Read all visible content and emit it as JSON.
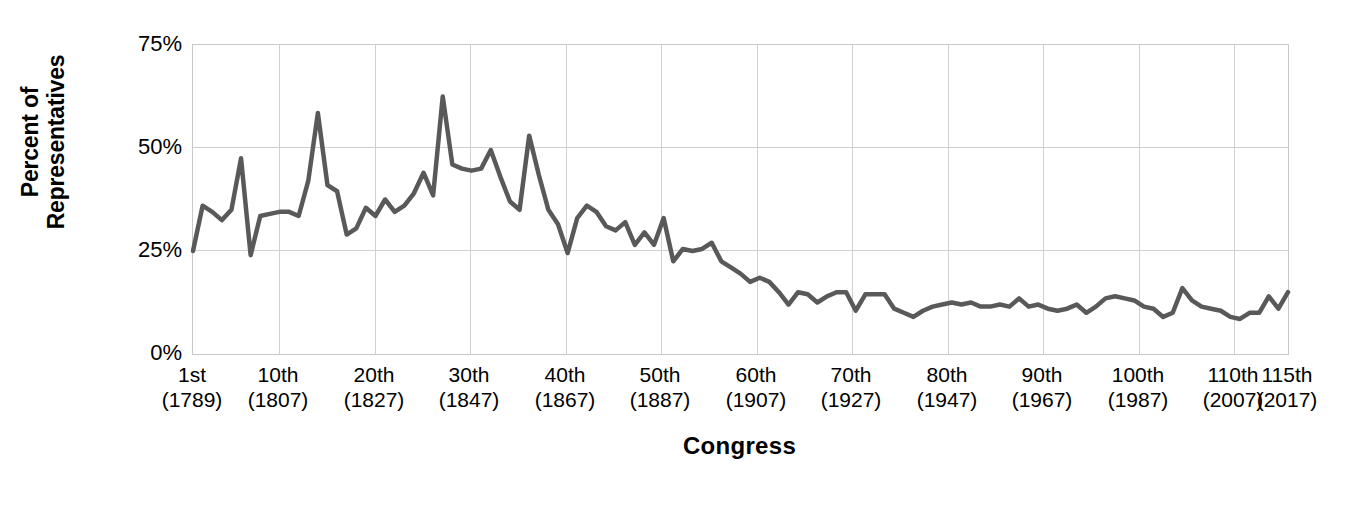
{
  "chart_data": {
    "type": "line",
    "title": "",
    "subtitle": "",
    "xlabel": "Congress",
    "ylabel": "Percent of\nRepresentatives",
    "ylabel_line1": "Percent of",
    "ylabel_line2": "Representatives",
    "ylim": [
      0,
      75
    ],
    "yticks": [
      0,
      25,
      50,
      75
    ],
    "ytick_labels": [
      "0%",
      "25%",
      "50%",
      "75%"
    ],
    "xlim": [
      1,
      115
    ],
    "grid": true,
    "legend": false,
    "legend_position": "none",
    "line_color": "#595959",
    "line_width": 4.5,
    "grid_color": "#d0d0d0",
    "background": "#ffffff",
    "xtick_positions": [
      1,
      10,
      20,
      30,
      40,
      50,
      60,
      70,
      80,
      90,
      100,
      110,
      115
    ],
    "xtick_labels": [
      {
        "ordinal": "1st",
        "year": "(1789)"
      },
      {
        "ordinal": "10th",
        "year": "(1807)"
      },
      {
        "ordinal": "20th",
        "year": "(1827)"
      },
      {
        "ordinal": "30th",
        "year": "(1847)"
      },
      {
        "ordinal": "40th",
        "year": "(1867)"
      },
      {
        "ordinal": "50th",
        "year": "(1887)"
      },
      {
        "ordinal": "60th",
        "year": "(1907)"
      },
      {
        "ordinal": "70th",
        "year": "(1927)"
      },
      {
        "ordinal": "80th",
        "year": "(1947)"
      },
      {
        "ordinal": "90th",
        "year": "(1967)"
      },
      {
        "ordinal": "100th",
        "year": "(1987)"
      },
      {
        "ordinal": "110th",
        "year": "(2007)"
      },
      {
        "ordinal": "115th",
        "year": "(2017)"
      }
    ],
    "x": [
      1,
      2,
      3,
      4,
      5,
      6,
      7,
      8,
      9,
      10,
      11,
      12,
      13,
      14,
      15,
      16,
      17,
      18,
      19,
      20,
      21,
      22,
      23,
      24,
      25,
      26,
      27,
      28,
      29,
      30,
      31,
      32,
      33,
      34,
      35,
      36,
      37,
      38,
      39,
      40,
      41,
      42,
      43,
      44,
      45,
      46,
      47,
      48,
      49,
      50,
      51,
      52,
      53,
      54,
      55,
      56,
      57,
      58,
      59,
      60,
      61,
      62,
      63,
      64,
      65,
      66,
      67,
      68,
      69,
      70,
      71,
      72,
      73,
      74,
      75,
      76,
      77,
      78,
      79,
      80,
      81,
      82,
      83,
      84,
      85,
      86,
      87,
      88,
      89,
      90,
      91,
      92,
      93,
      94,
      95,
      96,
      97,
      98,
      99,
      100,
      101,
      102,
      103,
      104,
      105,
      106,
      107,
      108,
      109,
      110,
      111,
      112,
      113,
      114,
      115
    ],
    "values": [
      25.0,
      36.0,
      34.5,
      32.5,
      35.0,
      47.5,
      24.0,
      33.5,
      34.0,
      34.5,
      34.5,
      33.5,
      42.0,
      58.5,
      41.0,
      39.5,
      29.0,
      30.5,
      35.5,
      33.5,
      37.5,
      34.5,
      36.0,
      39.0,
      44.0,
      38.5,
      62.5,
      46.0,
      45.0,
      44.5,
      45.0,
      49.5,
      43.0,
      37.0,
      35.0,
      53.0,
      43.5,
      35.0,
      31.5,
      24.5,
      33.0,
      36.0,
      34.5,
      31.0,
      30.0,
      32.0,
      26.5,
      29.5,
      26.5,
      33.0,
      22.5,
      25.5,
      25.0,
      25.5,
      27.0,
      22.5,
      21.0,
      19.5,
      17.5,
      18.5,
      17.5,
      15.0,
      12.0,
      15.0,
      14.5,
      12.5,
      14.0,
      15.0,
      15.0,
      10.5,
      14.5,
      14.5,
      14.5,
      11.0,
      10.0,
      9.0,
      10.5,
      11.5,
      12.0,
      12.5,
      12.0,
      12.5,
      11.5,
      11.5,
      12.0,
      11.5,
      13.5,
      11.5,
      12.0,
      11.0,
      10.5,
      11.0,
      12.0,
      10.0,
      11.5,
      13.5,
      14.0,
      13.5,
      13.0,
      11.5,
      11.0,
      9.0,
      10.0,
      16.0,
      13.0,
      11.5,
      11.0,
      10.5,
      9.0,
      8.5,
      10.0,
      10.0,
      14.0,
      11.0,
      15.0
    ]
  },
  "axis": {
    "y_title_line1": "Percent of",
    "y_title_line2": "Representatives",
    "x_title": "Congress",
    "ytick_0": "0%",
    "ytick_25": "25%",
    "ytick_50": "50%",
    "ytick_75": "75%"
  }
}
